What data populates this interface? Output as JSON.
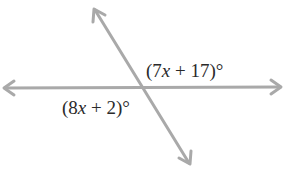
{
  "diagram": {
    "type": "intersecting-lines",
    "line_color": "#a9a9a9",
    "lines": [
      {
        "name": "horizontal-line",
        "from": [
          4,
          88
        ],
        "to": [
          281,
          87
        ],
        "arrows": "both"
      },
      {
        "name": "transversal-line",
        "from": [
          94,
          9
        ],
        "to": [
          190,
          164
        ],
        "arrows": "both"
      }
    ],
    "intersection": [
      141,
      87
    ],
    "angles": [
      {
        "position": "upper-right",
        "prefix": "(7",
        "variable": "x",
        "suffix": " + 17)°",
        "full_text": "(7x + 17)°"
      },
      {
        "position": "lower-left",
        "prefix": "(8",
        "variable": "x",
        "suffix": " + 2)°",
        "full_text": "(8x + 2)°"
      }
    ]
  }
}
